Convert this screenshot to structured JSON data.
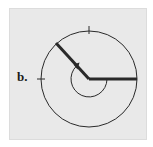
{
  "figure": {
    "label": "b.",
    "background_color": "#e9e9e9",
    "stroke_color": "#2a2a2a",
    "circle": {
      "cx": 89,
      "cy": 79,
      "r": 48
    },
    "rays": [
      {
        "name": "initial-side",
        "x1": 89,
        "y1": 79,
        "x2": 137,
        "y2": 79
      },
      {
        "name": "terminal-side",
        "x1": 89,
        "y1": 79,
        "x2": 56,
        "y2": 43
      }
    ],
    "ticks": [
      {
        "name": "top-tick",
        "x": 89,
        "y": 31,
        "orientation": "vertical"
      },
      {
        "name": "left-tick",
        "x": 41,
        "y": 79,
        "orientation": "horizontal"
      }
    ],
    "angle_arc": {
      "r": 18,
      "direction": "counterclockwise",
      "start_deg": 0,
      "end_deg": 227
    }
  }
}
